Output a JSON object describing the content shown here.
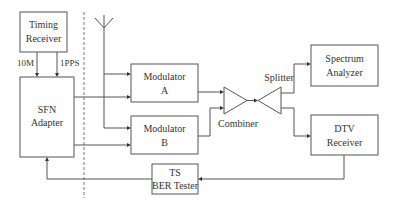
{
  "diagram": {
    "type": "block-diagram",
    "blocks": {
      "timing_receiver": {
        "line1": "Timing",
        "line2": "Receiver"
      },
      "sfn_adapter": {
        "line1": "SFN",
        "line2": "Adapter"
      },
      "modulator_a": {
        "line1": "Modulator",
        "line2": "A"
      },
      "modulator_b": {
        "line1": "Modulator",
        "line2": "B"
      },
      "combiner": {
        "label": "Combiner"
      },
      "splitter": {
        "label": "Splitter"
      },
      "spectrum_analyzer": {
        "line1": "Spectrum",
        "line2": "Analyzer"
      },
      "dtv_receiver": {
        "line1": "DTV",
        "line2": "Receiver"
      },
      "ts_ber_tester": {
        "line1": "TS",
        "line2": "BER Tester"
      }
    },
    "signals": {
      "ten_mhz": "10M",
      "one_pps": "1PPS"
    },
    "connections": [
      {
        "from": "Timing Receiver",
        "to": "SFN Adapter",
        "label": "10M"
      },
      {
        "from": "Timing Receiver",
        "to": "SFN Adapter",
        "label": "1PPS"
      },
      {
        "from": "Antenna",
        "to": "Modulator A"
      },
      {
        "from": "Antenna",
        "to": "Modulator B"
      },
      {
        "from": "SFN Adapter",
        "to": "Modulator A"
      },
      {
        "from": "SFN Adapter",
        "to": "Modulator B"
      },
      {
        "from": "Modulator A",
        "to": "Combiner"
      },
      {
        "from": "Modulator B",
        "to": "Combiner"
      },
      {
        "from": "Combiner",
        "to": "Splitter"
      },
      {
        "from": "Splitter",
        "to": "Spectrum Analyzer"
      },
      {
        "from": "Splitter",
        "to": "DTV Receiver"
      },
      {
        "from": "DTV Receiver",
        "to": "TS BER Tester"
      },
      {
        "from": "TS BER Tester",
        "to": "SFN Adapter"
      }
    ]
  }
}
